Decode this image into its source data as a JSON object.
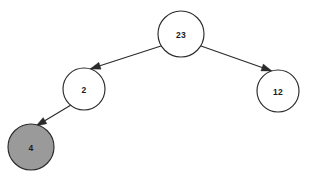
{
  "diagram": {
    "type": "tree",
    "background_color": "#ffffff",
    "stroke_color": "#2b2b2b",
    "node_fill_default": "#ffffff",
    "node_fill_highlight": "#9a9a9a",
    "label_color": "#1a1a1a",
    "nodes": [
      {
        "id": "n23",
        "label": "23",
        "cx": 181,
        "cy": 34,
        "r": 23,
        "fill": "#ffffff",
        "highlighted": false,
        "role": "root"
      },
      {
        "id": "n2",
        "label": "2",
        "cx": 84,
        "cy": 89,
        "r": 21,
        "fill": "#ffffff",
        "highlighted": false,
        "role": "left-child"
      },
      {
        "id": "n12",
        "label": "12",
        "cx": 278,
        "cy": 91,
        "r": 21,
        "fill": "#ffffff",
        "highlighted": false,
        "role": "right-child"
      },
      {
        "id": "n4",
        "label": "4",
        "cx": 31,
        "cy": 147,
        "r": 23,
        "fill": "#9a9a9a",
        "highlighted": true,
        "role": "leaf"
      }
    ],
    "edges": [
      {
        "id": "e-23-2",
        "from": "n23",
        "to": "n2",
        "x1": 161,
        "y1": 46,
        "x2": 90,
        "y2": 69,
        "arrow_at": "to"
      },
      {
        "id": "e-23-12",
        "from": "n23",
        "to": "n12",
        "x1": 201,
        "y1": 46,
        "x2": 272,
        "y2": 71,
        "arrow_at": "to"
      },
      {
        "id": "e-2-4",
        "from": "n2",
        "to": "n4",
        "x1": 71,
        "y1": 105,
        "x2": 36,
        "y2": 126,
        "arrow_at": "to"
      }
    ]
  }
}
